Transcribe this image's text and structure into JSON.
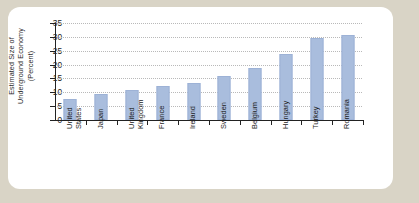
{
  "figure": {
    "card_background": "#ffffff",
    "page_background": "#d9d4c6",
    "bar_color": "#a9bddd",
    "axis_color": "#222222",
    "gridline_color": "#b9b9b9"
  },
  "chart_data": {
    "type": "bar",
    "title": "",
    "xlabel": "",
    "ylabel": "Estimated Size of\nUnderground Economy\n(Percent)",
    "ylim": [
      0,
      35
    ],
    "yticks": [
      0,
      5,
      10,
      15,
      20,
      25,
      30,
      35
    ],
    "ytick_labels": [
      "0",
      "5",
      "10",
      "15",
      "20",
      "25",
      "30",
      "35"
    ],
    "grid": true,
    "legend": "none",
    "categories": [
      "United\nStates",
      "Japan",
      "United\nKingdom",
      "France",
      "Ireland",
      "Sweden",
      "Belgium",
      "Hungary",
      "Turkey",
      "Romania"
    ],
    "values": [
      7.5,
      9.5,
      11.0,
      12.3,
      13.5,
      16.0,
      18.7,
      24.0,
      29.5,
      30.5
    ]
  }
}
